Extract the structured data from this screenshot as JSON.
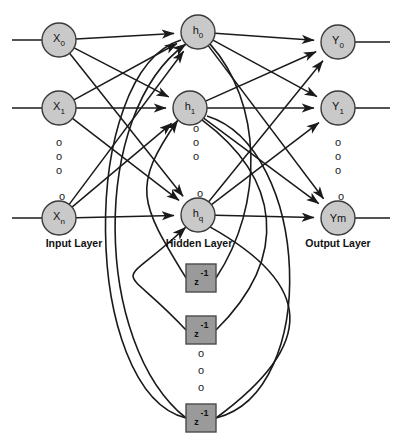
{
  "figure": {
    "title_fragment": "",
    "type": "recurrent-neural-network-architecture"
  },
  "colors": {
    "node_fill": "#c9c9c9",
    "node_stroke": "#3a3a3a",
    "delay_fill": "#9a9a9a",
    "delay_stroke": "#4a4a4a",
    "edge": "#1a1a1a",
    "background": "#ffffff",
    "text": "#111111"
  },
  "layers": [
    {
      "id": "input",
      "label": "Input Layer",
      "label_x": 74,
      "label_y": 237
    },
    {
      "id": "hidden",
      "label": "Hidden Layer",
      "label_x": 199,
      "label_y": 237
    },
    {
      "id": "output",
      "label": "Output Layer",
      "label_x": 338,
      "label_y": 237
    }
  ],
  "nodes": {
    "input": [
      {
        "name": "X",
        "sub": "0",
        "cx": 59,
        "cy": 40,
        "r": 17
      },
      {
        "name": "X",
        "sub": "1",
        "cx": 59,
        "cy": 108,
        "r": 17
      },
      {
        "name": "X",
        "sub": "n",
        "cx": 59,
        "cy": 218,
        "r": 17
      }
    ],
    "hidden": [
      {
        "name": "h",
        "sub": "0",
        "cx": 198,
        "cy": 32,
        "r": 17
      },
      {
        "name": "h",
        "sub": "1",
        "cx": 190,
        "cy": 108,
        "r": 17
      },
      {
        "name": "h",
        "sub": "q",
        "cx": 198,
        "cy": 215,
        "r": 17
      }
    ],
    "output": [
      {
        "name": "Y",
        "sub": "0",
        "cx": 338,
        "cy": 42,
        "r": 17
      },
      {
        "name": "Y",
        "sub": "1",
        "cx": 338,
        "cy": 108,
        "r": 17
      },
      {
        "name": "Ym",
        "sub": "",
        "cx": 338,
        "cy": 218,
        "r": 17
      }
    ]
  },
  "delay_blocks": [
    {
      "sup": "-1",
      "base": "z",
      "x": 186,
      "y": 264,
      "w": 30,
      "h": 28
    },
    {
      "sup": "-1",
      "base": "z",
      "x": 186,
      "y": 316,
      "w": 30,
      "h": 28
    },
    {
      "sup": "-1",
      "base": "z",
      "x": 186,
      "y": 404,
      "w": 30,
      "h": 28
    }
  ],
  "ellipses": [
    {
      "group": "input-column",
      "glyph": "o",
      "x": 59,
      "y": 142
    },
    {
      "group": "input-column",
      "glyph": "o",
      "x": 59,
      "y": 156
    },
    {
      "group": "input-column",
      "glyph": "o",
      "x": 59,
      "y": 170
    },
    {
      "group": "input-column",
      "glyph": "o",
      "x": 62,
      "y": 196
    },
    {
      "group": "hidden-column",
      "glyph": "o",
      "x": 196,
      "y": 128
    },
    {
      "group": "hidden-column",
      "glyph": "o",
      "x": 196,
      "y": 142
    },
    {
      "group": "hidden-column",
      "glyph": "o",
      "x": 196,
      "y": 156
    },
    {
      "group": "hidden-column",
      "glyph": "o",
      "x": 200,
      "y": 193
    },
    {
      "group": "output-column",
      "glyph": "o",
      "x": 338,
      "y": 142
    },
    {
      "group": "output-column",
      "glyph": "o",
      "x": 338,
      "y": 156
    },
    {
      "group": "output-column",
      "glyph": "o",
      "x": 338,
      "y": 170
    },
    {
      "group": "output-column",
      "glyph": "o",
      "x": 341,
      "y": 196
    },
    {
      "group": "delay-column",
      "glyph": "o",
      "x": 201,
      "y": 353
    },
    {
      "group": "delay-column",
      "glyph": "o",
      "x": 201,
      "y": 370
    },
    {
      "group": "delay-column",
      "glyph": "o",
      "x": 201,
      "y": 387
    }
  ],
  "stubs": {
    "input_left": [
      {
        "x1": 12,
        "y1": 40,
        "x2": 42,
        "y2": 40
      },
      {
        "x1": 12,
        "y1": 108,
        "x2": 42,
        "y2": 108
      },
      {
        "x1": 12,
        "y1": 218,
        "x2": 42,
        "y2": 218
      }
    ],
    "output_right": [
      {
        "x1": 355,
        "y1": 42,
        "x2": 390,
        "y2": 42
      },
      {
        "x1": 355,
        "y1": 108,
        "x2": 390,
        "y2": 108
      },
      {
        "x1": 355,
        "y1": 218,
        "x2": 390,
        "y2": 218
      }
    ]
  }
}
